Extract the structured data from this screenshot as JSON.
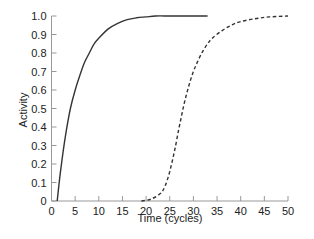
{
  "chart_data": {
    "type": "line",
    "title": "",
    "xlabel": "Time (cycles)",
    "ylabel": "Activity",
    "xlim": [
      0,
      50
    ],
    "ylim": [
      0,
      1.0
    ],
    "grid": false,
    "legend": null,
    "x_ticks": [
      0,
      5,
      10,
      15,
      20,
      25,
      30,
      35,
      40,
      45,
      50
    ],
    "x_tick_labels": [
      "0",
      "5",
      "10",
      "15",
      "20",
      "25",
      "30",
      "35",
      "40",
      "45",
      "50"
    ],
    "y_ticks": [
      0,
      0.1,
      0.2,
      0.3,
      0.4,
      0.5,
      0.6,
      0.7,
      0.8,
      0.9,
      1.0
    ],
    "y_tick_labels": [
      "0",
      "0.1",
      "0.2",
      "0.3",
      "0.4",
      "0.5",
      "0.6",
      "0.7",
      "0.8",
      "0.9",
      "1.0"
    ],
    "series": [
      {
        "name": "solid",
        "style": "solid",
        "color": "#333333",
        "x": [
          1.2,
          2,
          3,
          4,
          5,
          6,
          7,
          8,
          9,
          10,
          12,
          14,
          16,
          18,
          20,
          22,
          25,
          28,
          33
        ],
        "y": [
          0.0,
          0.18,
          0.36,
          0.5,
          0.6,
          0.68,
          0.75,
          0.8,
          0.85,
          0.88,
          0.93,
          0.96,
          0.98,
          0.99,
          0.995,
          1.0,
          1.0,
          1.0,
          1.0
        ]
      },
      {
        "name": "dashed",
        "style": "dashed",
        "color": "#333333",
        "x": [
          19,
          21,
          23,
          24,
          25,
          26,
          27,
          28,
          29,
          30,
          31,
          32,
          33,
          34,
          36,
          38,
          40,
          43,
          46,
          50
        ],
        "y": [
          0.0,
          0.01,
          0.04,
          0.08,
          0.16,
          0.27,
          0.4,
          0.52,
          0.62,
          0.7,
          0.76,
          0.81,
          0.85,
          0.88,
          0.92,
          0.95,
          0.97,
          0.985,
          0.995,
          1.0
        ]
      }
    ]
  }
}
